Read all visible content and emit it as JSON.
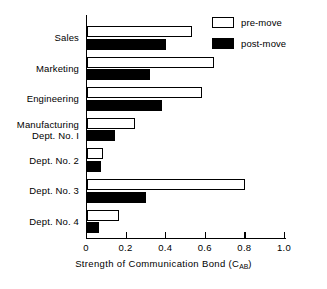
{
  "chart_data": {
    "type": "bar",
    "orientation": "horizontal",
    "title": "",
    "xlabel": "Strength of Communication Bond (C",
    "xlabel_sub": "AB",
    "xlabel_tail": ")",
    "ylabel": "",
    "xlim": [
      0,
      1.0
    ],
    "xticks": [
      0,
      0.2,
      0.4,
      0.6,
      0.8,
      1.0
    ],
    "xtick_labels": [
      "0",
      "0.2",
      "0.4",
      "0.6",
      "0.8",
      "1.0"
    ],
    "grid": false,
    "legend_position": "top-right",
    "categories": [
      "Sales",
      "Marketing",
      "Engineering",
      "Manufacturing\nDept. No. 1",
      "Dept. No. 2",
      "Dept. No. 3",
      "Dept. No. 4"
    ],
    "category_lines": [
      [
        "Sales"
      ],
      [
        "Marketing"
      ],
      [
        "Engineering"
      ],
      [
        "Manufacturing",
        "Dept. No. I"
      ],
      [
        "Dept. No. 2"
      ],
      [
        "Dept. No. 3"
      ],
      [
        "Dept. No. 4"
      ]
    ],
    "series": [
      {
        "name": "pre-move",
        "style": "hollow",
        "color": "#ffffff",
        "edge_color": "#000000",
        "values": [
          0.53,
          0.64,
          0.58,
          0.24,
          0.08,
          0.8,
          0.16
        ]
      },
      {
        "name": "post-move",
        "style": "filled",
        "color": "#000000",
        "edge_color": "#000000",
        "values": [
          0.4,
          0.32,
          0.38,
          0.14,
          0.07,
          0.3,
          0.06
        ]
      }
    ]
  },
  "legend": {
    "items": [
      {
        "label": "pre-move",
        "style": "hollow"
      },
      {
        "label": "post-move",
        "style": "filled"
      }
    ]
  }
}
